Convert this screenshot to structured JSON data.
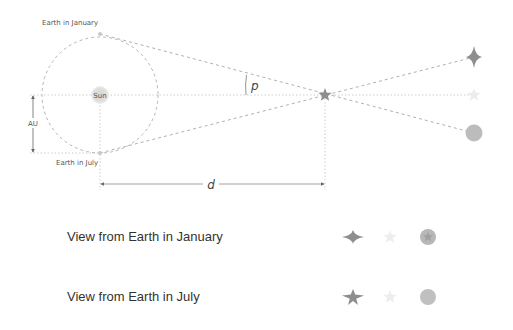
{
  "labels": {
    "earth_january": "Earth in January",
    "earth_july": "Earth in July",
    "sun": "Sun",
    "au": "AU",
    "parallax_angle": "p",
    "distance": "d"
  },
  "views": [
    {
      "label": "View from Earth in January",
      "objects": [
        "four-point-star",
        "faint-star",
        "circle-with-star"
      ]
    },
    {
      "label": "View from Earth in July",
      "objects": [
        "four-point-star",
        "faint-star",
        "circle"
      ]
    }
  ],
  "colors": {
    "line": "#b0b0b0",
    "star": "#8a8a8a",
    "faint_star": "#e6e6e6",
    "circle": "#bdbdbd",
    "sun": "#d9d9d9",
    "text": "#333333"
  }
}
